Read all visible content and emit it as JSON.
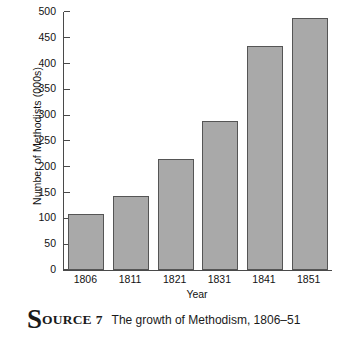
{
  "chart_data": {
    "type": "bar",
    "title": "",
    "categories": [
      "1806",
      "1811",
      "1821",
      "1831",
      "1841",
      "1851"
    ],
    "values": [
      109,
      143,
      215,
      288,
      435,
      489
    ],
    "xlabel": "Year",
    "ylabel": "Number of Methodists (000s)",
    "ylim": [
      0,
      500
    ],
    "ytick_labels": [
      "0",
      "50",
      "100",
      "150",
      "200",
      "250",
      "300",
      "350",
      "400",
      "450",
      "500"
    ],
    "ytick_values": [
      0,
      50,
      100,
      150,
      200,
      250,
      300,
      350,
      400,
      450,
      500
    ],
    "grid": false,
    "legend": false,
    "bar_color": "#a9a9a9",
    "bar_edge_color": "#555555",
    "axis_color": "#4a4a4a"
  },
  "caption": {
    "dropcap": "S",
    "smallcaps": "OURCE",
    "number": "7",
    "text": "The growth of Methodism, 1806–51"
  }
}
